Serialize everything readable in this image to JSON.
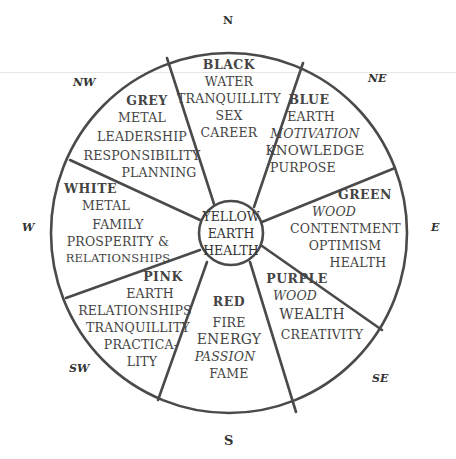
{
  "diagram": {
    "compass": {
      "N": "N",
      "NE": "NE",
      "E": "E",
      "SE": "SE",
      "S": "S",
      "SW": "SW",
      "W": "W",
      "NW": "NW"
    },
    "center": {
      "color": "YELLOW",
      "element": "EARTH",
      "aspects": [
        "HEALTH"
      ]
    },
    "sectors": [
      {
        "direction": "N",
        "color": "BLACK",
        "element": "WATER",
        "aspects": [
          "TRANQUILLITY",
          "SEX",
          "CAREER"
        ]
      },
      {
        "direction": "NE",
        "color": "BLUE",
        "element": "EARTH",
        "aspects": [
          "MOTIVATION",
          "KNOWLEDGE",
          "PURPOSE"
        ]
      },
      {
        "direction": "E",
        "color": "GREEN",
        "element": "WOOD",
        "aspects": [
          "CONTENTMENT",
          "OPTIMISM",
          "HEALTH"
        ]
      },
      {
        "direction": "SE",
        "color": "PURPLE",
        "element": "WOOD",
        "aspects": [
          "WEALTH",
          "CREATIVITY"
        ]
      },
      {
        "direction": "S",
        "color": "RED",
        "element": "FIRE",
        "aspects": [
          "ENERGY",
          "PASSION",
          "FAME"
        ]
      },
      {
        "direction": "SW",
        "color": "PINK",
        "element": "EARTH",
        "aspects": [
          "RELATIONSHIPS",
          "TRANQUILLITY",
          "PRACTICA-",
          "LITY"
        ]
      },
      {
        "direction": "W",
        "color": "WHITE",
        "element": "METAL",
        "aspects": [
          "FAMILY",
          "PROSPERITY &",
          "RELATIONSHIPS"
        ]
      },
      {
        "direction": "NW",
        "color": "GREY",
        "element": "METAL",
        "aspects": [
          "LEADERSHIP",
          "RESPONSIBILITY",
          "PLANNING"
        ]
      }
    ]
  }
}
